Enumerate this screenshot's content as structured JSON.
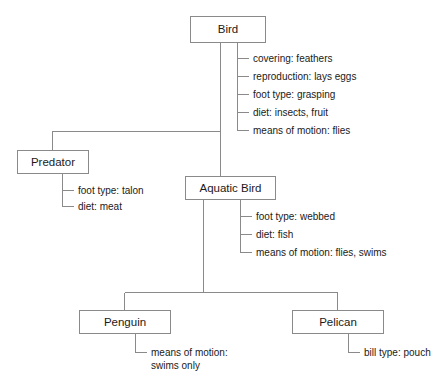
{
  "diagram": {
    "type": "hierarchy-tree-with-attributes",
    "colors": {
      "stroke": "#8a8a8a",
      "text": "#1a1a1a",
      "background": "#ffffff"
    },
    "nodes": [
      {
        "id": "bird",
        "label": "Bird",
        "box": {
          "x": 190,
          "y": 16,
          "w": 75,
          "h": 26
        },
        "attributes": [
          "covering: feathers",
          "reproduction: lays eggs",
          "foot type: grasping",
          "diet: insects, fruit",
          "means of motion: flies"
        ]
      },
      {
        "id": "predator",
        "label": "Predator",
        "box": {
          "x": 17,
          "y": 150,
          "w": 71,
          "h": 23
        },
        "attributes": [
          "foot type: talon",
          "diet: meat"
        ]
      },
      {
        "id": "aquatic-bird",
        "label": "Aquatic Bird",
        "box": {
          "x": 185,
          "y": 176,
          "w": 90,
          "h": 23
        },
        "attributes": [
          "foot type: webbed",
          "diet: fish",
          "means of motion: flies, swims"
        ]
      },
      {
        "id": "penguin",
        "label": "Penguin",
        "box": {
          "x": 79,
          "y": 310,
          "w": 91,
          "h": 23
        },
        "attributes": [
          "means of motion:",
          "swims only"
        ]
      },
      {
        "id": "pelican",
        "label": "Pelican",
        "box": {
          "x": 292,
          "y": 310,
          "w": 91,
          "h": 23
        },
        "attributes": [
          "bill type: pouch"
        ]
      }
    ],
    "edges": [
      {
        "from": "bird",
        "to": "predator"
      },
      {
        "from": "bird",
        "to": "aquatic-bird"
      },
      {
        "from": "aquatic-bird",
        "to": "penguin"
      },
      {
        "from": "aquatic-bird",
        "to": "pelican"
      }
    ]
  }
}
